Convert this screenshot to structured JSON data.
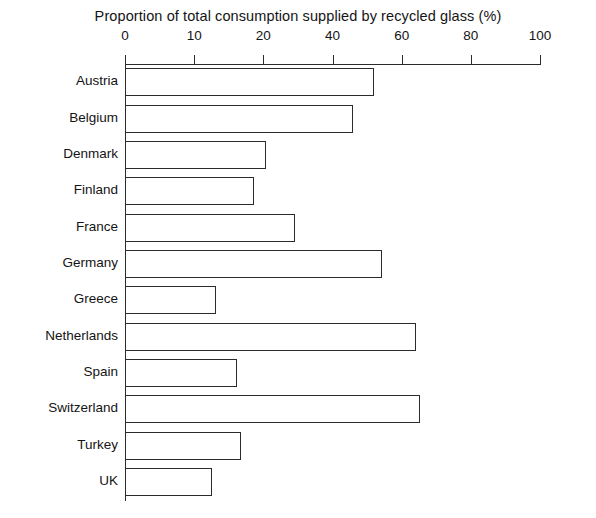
{
  "chart_data": {
    "type": "bar",
    "orientation": "horizontal",
    "title": "Proportion of total consumption supplied by recycled glass (%)",
    "xlabel": "",
    "ylabel": "",
    "xlim": [
      0,
      100
    ],
    "grid": false,
    "legend": "none",
    "xticks": [
      {
        "label": "0",
        "value": 0
      },
      {
        "label": "10",
        "value": 16.67
      },
      {
        "label": "20",
        "value": 33.33
      },
      {
        "label": "40",
        "value": 50
      },
      {
        "label": "60",
        "value": 66.67
      },
      {
        "label": "80",
        "value": 83.33
      },
      {
        "label": "100",
        "value": 100
      }
    ],
    "xtick_labels": [
      "0",
      "10",
      "20",
      "40",
      "60",
      "80",
      "100"
    ],
    "categories": [
      "Austria",
      "Belgium",
      "Denmark",
      "Finland",
      "France",
      "Germany",
      "Greece",
      "Netherlands",
      "Spain",
      "Switzerland",
      "Turkey",
      "UK"
    ],
    "values": [
      60,
      55,
      34,
      31,
      41,
      62,
      22,
      70,
      27,
      71,
      28,
      21
    ],
    "bar_style": {
      "fill": "#ffffff",
      "outline": "#2b2b2b"
    }
  }
}
